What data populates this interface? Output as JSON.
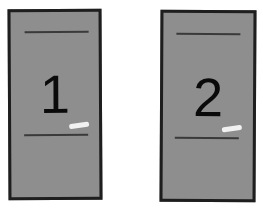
{
  "cards": [
    {
      "label": "1",
      "fill_color": "#8e8e8e",
      "border_color": "#1e1e1e"
    },
    {
      "label": "2",
      "fill_color": "#8e8e8e",
      "border_color": "#1e1e1e"
    }
  ]
}
